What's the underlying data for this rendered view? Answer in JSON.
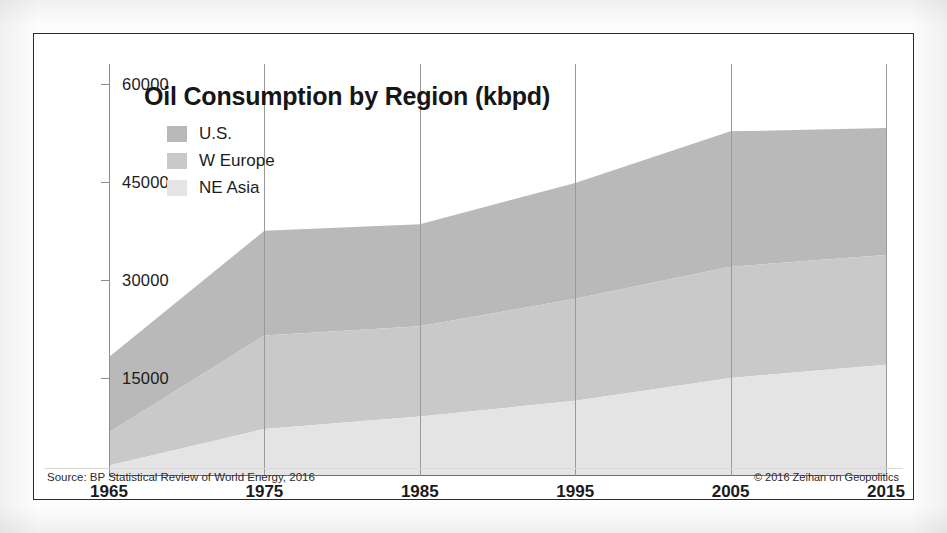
{
  "figure": {
    "title": "Oil Consumption by Region (kbpd)",
    "source": "Source: BP Statistical Review of World Energy, 2016",
    "credit": "© 2016 Zeihan on Geopolitics"
  },
  "colors": {
    "us": "#b9b9b9",
    "w_europe": "#c9c9c9",
    "ne_asia": "#e4e4e4",
    "frame": "#2a2a2a",
    "grid": "#9a9a9a",
    "text": "#1b1b1b"
  },
  "chart_data": {
    "type": "area",
    "stacked": true,
    "title": "Oil Consumption by Region (kbpd)",
    "xlabel": "",
    "ylabel": "",
    "x": [
      1965,
      1975,
      1985,
      1995,
      2005,
      2015
    ],
    "xtick_labels": [
      "1965",
      "1975",
      "1985",
      "1995",
      "2005",
      "2015"
    ],
    "ytick_labels": [
      "60000",
      "45000",
      "30000",
      "15000"
    ],
    "yticks": [
      60000,
      45000,
      30000,
      15000
    ],
    "ylim": [
      0,
      63000
    ],
    "xlim": [
      1965,
      2015
    ],
    "grid": "vertical",
    "legend_position": "top-left",
    "stack_order_bottom_to_top": [
      "NE Asia",
      "W Europe",
      "U.S."
    ],
    "series": [
      {
        "name": "U.S.",
        "color": "#b9b9b9",
        "values": [
          11500,
          16000,
          15600,
          17700,
          20700,
          19400
        ]
      },
      {
        "name": "W Europe",
        "color": "#c9c9c9",
        "values": [
          5100,
          14300,
          13800,
          15600,
          17000,
          16800
        ]
      },
      {
        "name": "NE Asia",
        "color": "#e4e4e4",
        "values": [
          1600,
          7200,
          9100,
          11500,
          15000,
          17000
        ]
      }
    ],
    "stack_totals": [
      18200,
      37500,
      38500,
      44800,
      52700,
      53200
    ],
    "cumulative_ne_asia": [
      1600,
      7200,
      9100,
      11500,
      15000,
      17000
    ],
    "cumulative_ne_asia_plus_w_europe": [
      6700,
      21500,
      22900,
      27100,
      32000,
      33800
    ]
  }
}
